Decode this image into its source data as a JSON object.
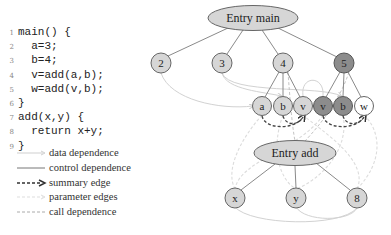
{
  "code": {
    "lines": [
      {
        "num": "1",
        "text": "main() {"
      },
      {
        "num": "2",
        "text": "  a=3;"
      },
      {
        "num": "3",
        "text": "  b=4;"
      },
      {
        "num": "4",
        "text": "  v=add(a,b);"
      },
      {
        "num": "5",
        "text": "  w=add(v,b);"
      },
      {
        "num": "6",
        "text": "}"
      },
      {
        "num": "7",
        "text": "add(x,y) {"
      },
      {
        "num": "8",
        "text": "  return x+y;"
      },
      {
        "num": "9",
        "text": "}"
      }
    ]
  },
  "legend": {
    "items": [
      {
        "label": "data dependence",
        "style": "data"
      },
      {
        "label": "control dependence",
        "style": "control"
      },
      {
        "label": "summary edge",
        "style": "summary"
      },
      {
        "label": "parameter edges",
        "style": "parameter"
      },
      {
        "label": "call dependence",
        "style": "call"
      }
    ]
  },
  "graph": {
    "entry_main": {
      "label": "Entry main"
    },
    "entry_add": {
      "label": "Entry add"
    },
    "stmt_nodes": [
      {
        "label": "2",
        "shade": "light"
      },
      {
        "label": "3",
        "shade": "light"
      },
      {
        "label": "4",
        "shade": "light"
      },
      {
        "label": "5",
        "shade": "dark"
      }
    ],
    "param_nodes": [
      {
        "label": "a",
        "shade": "light"
      },
      {
        "label": "b",
        "shade": "light"
      },
      {
        "label": "v",
        "shade": "light"
      },
      {
        "label": "v",
        "shade": "dark"
      },
      {
        "label": "b",
        "shade": "dark"
      },
      {
        "label": "w",
        "shade": "white"
      }
    ],
    "add_nodes": [
      {
        "label": "x",
        "shade": "light"
      },
      {
        "label": "y",
        "shade": "light"
      },
      {
        "label": "8",
        "shade": "light"
      }
    ],
    "colors": {
      "light_fill": "#d6d6d6",
      "dark_fill": "#8c8c8c",
      "white_fill": "#ffffff",
      "control_edge": "#888888",
      "data_edge": "#cfcfcf",
      "summary_edge": "#444444",
      "parameter_edge": "#dddddd",
      "call_edge": "#bbbbbb"
    }
  }
}
